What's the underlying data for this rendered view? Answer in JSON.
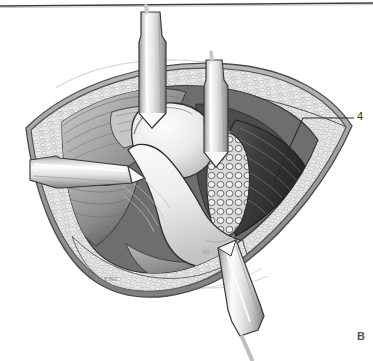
{
  "figure": {
    "panel_label": "B",
    "artist_signature": "ENC",
    "callouts": [
      {
        "id": "4",
        "text": "4"
      }
    ],
    "style": {
      "ink": "#2b2b2b",
      "line": "#3a3a3a",
      "skin_edge": "#9a9a9a",
      "fat_fill": "#e3e3e3",
      "fat_cell": "#8f8f8f",
      "muscle_light": "#d9d9d9",
      "muscle_mid": "#b4b4b4",
      "muscle_dark": "#6f6f6f",
      "bone_light": "#f2f2f2",
      "bone_mid": "#d2d2d2",
      "bone_shadow": "#a8a8a8",
      "capsule_dark": "#3d3d3d",
      "deep_shadow": "#2e2e2e",
      "metal_light": "#f4f4f4",
      "metal_mid": "#c9c9c9",
      "metal_dark": "#8e8e8e",
      "background": "#ffffff",
      "top_rule": "#3d3d3d"
    },
    "elements": {
      "top_rule": "horizontal-rule",
      "retractors": [
        {
          "name": "retractor-superior-left"
        },
        {
          "name": "retractor-superior-right"
        },
        {
          "name": "retractor-lateral-left"
        },
        {
          "name": "retractor-inferior"
        }
      ],
      "anatomy": [
        {
          "name": "skin-margin"
        },
        {
          "name": "subcutaneous-fat"
        },
        {
          "name": "muscle-layer"
        },
        {
          "name": "femoral-head"
        },
        {
          "name": "femoral-neck"
        },
        {
          "name": "joint-capsule"
        }
      ]
    }
  }
}
